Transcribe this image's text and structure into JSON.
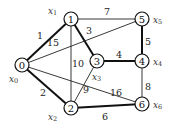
{
  "diagram": {
    "type": "weighted-graph",
    "nodes": [
      {
        "id": "0",
        "label": "0",
        "var": "x",
        "sub": "0",
        "x": 22,
        "y": 65,
        "lx": 9,
        "ly": 79
      },
      {
        "id": "1",
        "label": "1",
        "var": "x",
        "sub": "1",
        "x": 71,
        "y": 19,
        "lx": 48,
        "ly": 11
      },
      {
        "id": "2",
        "label": "2",
        "var": "x",
        "sub": "2",
        "x": 71,
        "y": 108,
        "lx": 48,
        "ly": 117
      },
      {
        "id": "3",
        "label": "3",
        "var": "x",
        "sub": "3",
        "x": 97,
        "y": 61,
        "lx": 92,
        "ly": 77
      },
      {
        "id": "4",
        "label": "4",
        "var": "x",
        "sub": "4",
        "x": 142,
        "y": 61,
        "lx": 153,
        "ly": 62
      },
      {
        "id": "5",
        "label": "5",
        "var": "x",
        "sub": "5",
        "x": 142,
        "y": 19,
        "lx": 153,
        "ly": 20
      },
      {
        "id": "6",
        "label": "6",
        "var": "x",
        "sub": "6",
        "x": 142,
        "y": 104,
        "lx": 153,
        "ly": 105
      }
    ],
    "edges": [
      {
        "from": "0",
        "to": "1",
        "weight": "1",
        "bold": true,
        "wx": 40,
        "wy": 35
      },
      {
        "from": "0",
        "to": "2",
        "weight": "2",
        "bold": true,
        "wx": 43,
        "wy": 92
      },
      {
        "from": "1",
        "to": "3",
        "weight": "3",
        "bold": true,
        "wx": 89,
        "wy": 30
      },
      {
        "from": "3",
        "to": "4",
        "weight": "4",
        "bold": true,
        "wx": 119,
        "wy": 54
      },
      {
        "from": "5",
        "to": "4",
        "weight": "5",
        "bold": true,
        "wx": 148,
        "wy": 41
      },
      {
        "from": "2",
        "to": "6",
        "weight": "6",
        "bold": true,
        "wx": 105,
        "wy": 116
      },
      {
        "from": "1",
        "to": "5",
        "weight": "7",
        "bold": false,
        "wx": 107,
        "wy": 11
      },
      {
        "from": "4",
        "to": "6",
        "weight": "8",
        "bold": false,
        "wx": 148,
        "wy": 86
      },
      {
        "from": "2",
        "to": "3",
        "weight": "9",
        "bold": false,
        "wx": 86,
        "wy": 89
      },
      {
        "from": "1",
        "to": "2",
        "weight": "10",
        "bold": false,
        "wx": 78,
        "wy": 63
      },
      {
        "from": "0",
        "to": "5",
        "weight": "15",
        "bold": false,
        "wx": 53,
        "wy": 42
      },
      {
        "from": "0",
        "to": "6",
        "weight": "16",
        "bold": false,
        "wx": 116,
        "wy": 92
      }
    ],
    "highlighted_edges_note": "Bold edges form the minimum spanning tree"
  }
}
